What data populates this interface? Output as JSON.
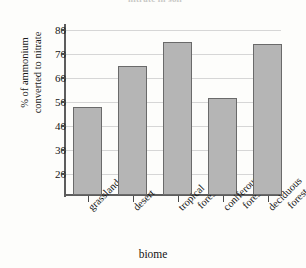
{
  "figure": {
    "cropped_title": "nitrate in soil",
    "background_color": "#fdfdfb"
  },
  "axes": {
    "y_title_line1": "% of ammonium",
    "y_title_line2": "converted to nitrate",
    "x_title": "biome",
    "y_ticks": [
      "80",
      "70",
      "60",
      "50",
      "40",
      "30",
      "20"
    ]
  },
  "bars": [
    {
      "label_line1": "grassland",
      "label_line2": "",
      "value": 48
    },
    {
      "label_line1": "desert",
      "label_line2": "",
      "value": 65
    },
    {
      "label_line1": "tropical",
      "label_line2": "forest",
      "value": 75
    },
    {
      "label_line1": "coniferous",
      "label_line2": "forest",
      "value": 51.5
    },
    {
      "label_line1": "deciduous",
      "label_line2": "forest",
      "value": 74
    }
  ],
  "chart_data": {
    "type": "bar",
    "title": "",
    "categories": [
      "grassland",
      "desert",
      "tropical forest",
      "coniferous forest",
      "deciduous forest"
    ],
    "values": [
      48,
      65,
      75,
      51.5,
      74
    ],
    "xlabel": "biome",
    "ylabel": "% of ammonium converted to nitrate",
    "ylim": [
      15,
      84
    ],
    "yticks": [
      20,
      30,
      40,
      50,
      60,
      70,
      80
    ],
    "grid": true,
    "legend": false,
    "bar_fill_color": "#b5b5b5",
    "bar_edge_color": "#6a6a6a"
  }
}
